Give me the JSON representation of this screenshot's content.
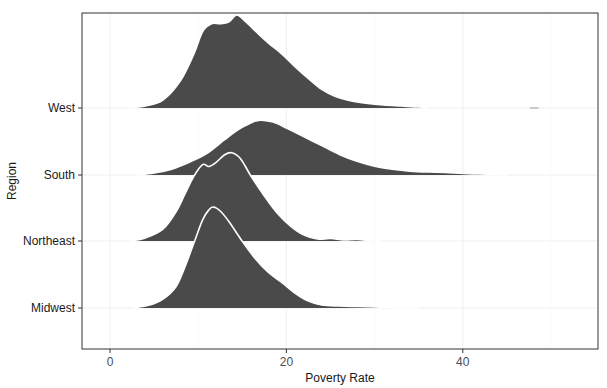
{
  "chart_data": {
    "type": "ridgeline",
    "title": "",
    "xlabel": "Poverty Rate",
    "ylabel": "Region",
    "xlim": [
      -3.2,
      55.5
    ],
    "x_ticks": [
      0,
      20,
      40
    ],
    "x_tick_labels": [
      "0",
      "20",
      "40"
    ],
    "categories": [
      "Midwest",
      "Northeast",
      "South",
      "West"
    ],
    "grid": true,
    "legend": "none",
    "fill_color": "#4a4a4a",
    "outline_color": "#ffffff",
    "series": [
      {
        "name": "West",
        "peak_x": 14.4,
        "range": [
          2,
          36
        ],
        "density_points": [
          [
            2,
            0
          ],
          [
            4,
            2
          ],
          [
            6,
            8
          ],
          [
            8,
            28
          ],
          [
            9.5,
            55
          ],
          [
            10.5,
            78
          ],
          [
            11.5,
            86
          ],
          [
            12.5,
            86
          ],
          [
            13.5,
            88
          ],
          [
            14.4,
            95
          ],
          [
            15.5,
            87
          ],
          [
            17,
            74
          ],
          [
            18,
            66
          ],
          [
            19.5,
            55
          ],
          [
            21,
            42
          ],
          [
            22.5,
            30
          ],
          [
            24,
            19
          ],
          [
            25.5,
            12
          ],
          [
            27,
            8
          ],
          [
            29,
            5
          ],
          [
            31,
            3
          ],
          [
            33,
            2
          ],
          [
            35,
            1
          ],
          [
            36,
            0
          ]
        ]
      },
      {
        "name": "South",
        "peak_x": 17.2,
        "range": [
          3,
          45
        ],
        "density_points": [
          [
            3,
            0
          ],
          [
            5,
            2
          ],
          [
            7,
            6
          ],
          [
            9,
            13
          ],
          [
            11,
            22
          ],
          [
            13,
            36
          ],
          [
            14.5,
            46
          ],
          [
            15.5,
            51
          ],
          [
            16.5,
            55
          ],
          [
            17.2,
            56
          ],
          [
            18.5,
            54
          ],
          [
            20,
            48
          ],
          [
            22,
            39
          ],
          [
            24,
            30
          ],
          [
            26,
            21
          ],
          [
            28,
            14
          ],
          [
            30,
            9
          ],
          [
            32,
            6
          ],
          [
            34,
            4
          ],
          [
            36,
            3
          ],
          [
            38,
            2.5
          ],
          [
            40,
            1.5
          ],
          [
            42,
            1
          ],
          [
            44,
            0.5
          ],
          [
            45,
            0
          ]
        ]
      },
      {
        "name": "Northeast",
        "peak_x": 13.8,
        "range": [
          2.3,
          30.7
        ],
        "density_points": [
          [
            2.3,
            0
          ],
          [
            4,
            3
          ],
          [
            6,
            12
          ],
          [
            7.5,
            30
          ],
          [
            8.5,
            48
          ],
          [
            9.5,
            66
          ],
          [
            10.5,
            78
          ],
          [
            11.2,
            76
          ],
          [
            12,
            80
          ],
          [
            13,
            88
          ],
          [
            13.8,
            90
          ],
          [
            14.8,
            84
          ],
          [
            16,
            66
          ],
          [
            17.5,
            46
          ],
          [
            19,
            28
          ],
          [
            20.5,
            15
          ],
          [
            22,
            6
          ],
          [
            23.5,
            2
          ],
          [
            25,
            2.5
          ],
          [
            26.5,
            1
          ],
          [
            28,
            1.5
          ],
          [
            29.5,
            0.5
          ],
          [
            30.7,
            0
          ]
        ]
      },
      {
        "name": "Midwest",
        "peak_x": 11.7,
        "range": [
          2.6,
          35
        ],
        "density_points": [
          [
            2.6,
            0
          ],
          [
            4.5,
            3
          ],
          [
            6,
            9
          ],
          [
            7.5,
            22
          ],
          [
            8.5,
            42
          ],
          [
            9.5,
            66
          ],
          [
            10.5,
            90
          ],
          [
            11.2,
            100
          ],
          [
            11.7,
            103
          ],
          [
            12.5,
            99
          ],
          [
            13.5,
            88
          ],
          [
            15,
            68
          ],
          [
            16.5,
            50
          ],
          [
            18,
            36
          ],
          [
            19.5,
            26
          ],
          [
            21,
            15
          ],
          [
            22.5,
            7
          ],
          [
            24,
            3
          ],
          [
            26,
            2
          ],
          [
            28,
            1.5
          ],
          [
            30,
            1
          ],
          [
            32,
            0.5
          ],
          [
            35,
            0
          ]
        ]
      }
    ]
  },
  "axes": {
    "x_title": "Poverty Rate",
    "y_title": "Region",
    "y_labels": [
      "West",
      "South",
      "Northeast",
      "Midwest"
    ],
    "x_labels": [
      "0",
      "20",
      "40"
    ]
  }
}
